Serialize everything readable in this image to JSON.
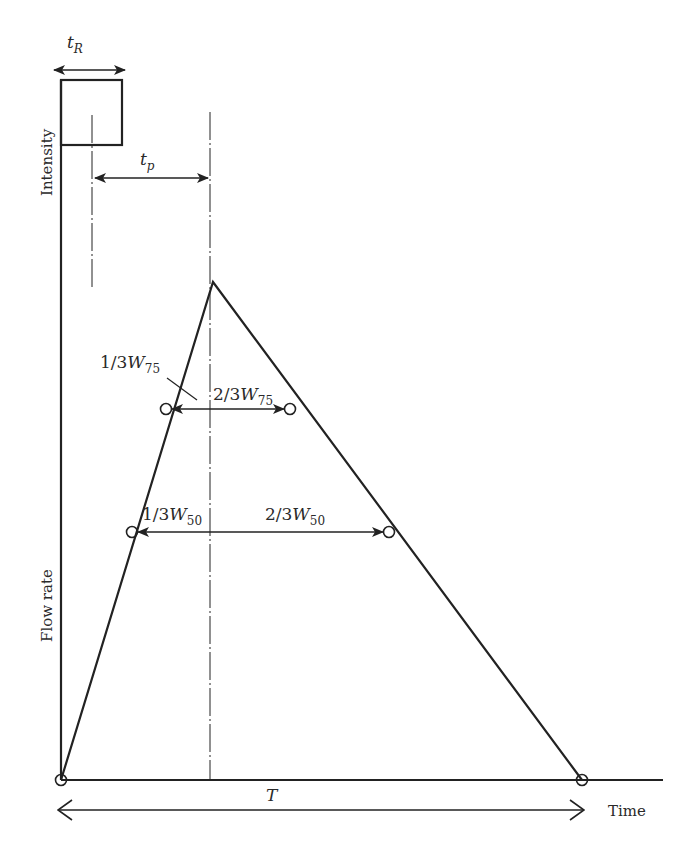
{
  "diagram": {
    "type": "triangular unit hydrograph with rainfall block",
    "axes": {
      "y_upper_label": "Intensity",
      "y_lower_label": "Flow rate",
      "x_label": "Time"
    },
    "labels": {
      "tR": {
        "base": "t",
        "sub": "R"
      },
      "tp": {
        "base": "t",
        "sub": "p"
      },
      "T": "T",
      "w75_left": {
        "prefix": "1/3",
        "base": "W",
        "sub": "75"
      },
      "w75_right": {
        "prefix": "2/3",
        "base": "W",
        "sub": "75"
      },
      "w50_left": {
        "prefix": "1/3",
        "base": "W",
        "sub": "50"
      },
      "w50_right": {
        "prefix": "2/3",
        "base": "W",
        "sub": "50"
      }
    },
    "colors": {
      "line": "#222222",
      "background": "#ffffff"
    }
  }
}
